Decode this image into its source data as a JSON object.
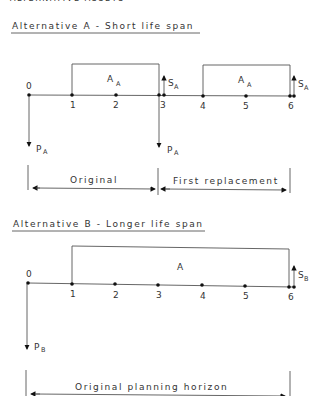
{
  "top_cut_text": "ALTERNATIVE ASSETS",
  "alt_a": {
    "title": "Alternative A - Short life span",
    "periods": [
      "0",
      "1",
      "2",
      "3",
      "4",
      "5",
      "6"
    ],
    "annuity_label": "A",
    "annuity_sub": "A",
    "salvage_label": "S",
    "salvage_sub": "A",
    "purchase_label": "P",
    "purchase_sub": "A",
    "spans": [
      {
        "label": "Original"
      },
      {
        "label": "First replacement"
      }
    ]
  },
  "alt_b": {
    "title": "Alternative B - Longer life span",
    "periods": [
      "0",
      "1",
      "2",
      "3",
      "4",
      "5",
      "6"
    ],
    "annuity_label": "A",
    "salvage_label": "S",
    "salvage_sub": "B",
    "purchase_label": "P",
    "purchase_sub": "B",
    "span_label": "Original planning horizon"
  }
}
